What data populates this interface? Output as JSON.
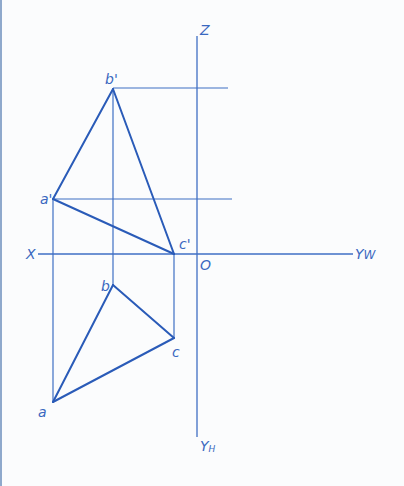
{
  "diagram": {
    "type": "orthographic-projection",
    "colors": {
      "line": "#3f6fc4",
      "edge": "#2a5bb8",
      "text": "#3a68c0",
      "background": "#fbfcfd",
      "border": "#8fa9cc"
    },
    "axes": {
      "z_label": "Z",
      "x_label": "X",
      "yw_label": "Y",
      "yw_sub": "W",
      "yh_label": "Y",
      "yh_sub": "H",
      "origin_label": "O"
    },
    "points": {
      "a_prime": {
        "label": "a'",
        "x": 53,
        "y": 199
      },
      "b_prime": {
        "label": "b'",
        "x": 113,
        "y": 89
      },
      "c_prime": {
        "label": "c'",
        "x": 174,
        "y": 254
      },
      "a": {
        "label": "a",
        "x": 53,
        "y": 402
      },
      "b": {
        "label": "b",
        "x": 113,
        "y": 285
      },
      "c": {
        "label": "c",
        "x": 174,
        "y": 338
      }
    },
    "front_view": [
      "a'",
      "b'",
      "c'"
    ],
    "top_view": [
      "a",
      "b",
      "c"
    ]
  }
}
